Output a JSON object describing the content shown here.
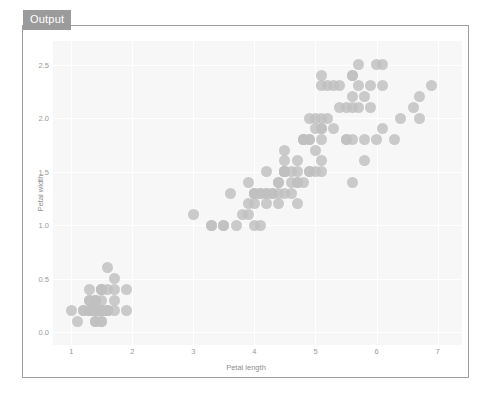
{
  "panel": {
    "tab_label": "Output"
  },
  "chart_data": {
    "type": "scatter",
    "title": "",
    "xlabel": "Petal length",
    "ylabel": "Petal width",
    "xlim": [
      0.7,
      7.4
    ],
    "ylim": [
      -0.12,
      2.72
    ],
    "xticks": [
      "1",
      "2",
      "3",
      "4",
      "5",
      "6",
      "7"
    ],
    "xtick_values": [
      1,
      2,
      3,
      4,
      5,
      6,
      7
    ],
    "yticks": [
      "0.0",
      "0.5",
      "1.0",
      "1.5",
      "2.0",
      "2.5"
    ],
    "ytick_values": [
      0.0,
      0.5,
      1.0,
      1.5,
      2.0,
      2.5
    ],
    "grid": true,
    "legend": "none",
    "marker_color": "#c0c0c0",
    "plot_background": "#f7f7f7",
    "points": [
      [
        1.4,
        0.2
      ],
      [
        1.4,
        0.2
      ],
      [
        1.3,
        0.2
      ],
      [
        1.5,
        0.2
      ],
      [
        1.4,
        0.2
      ],
      [
        1.7,
        0.4
      ],
      [
        1.4,
        0.3
      ],
      [
        1.5,
        0.2
      ],
      [
        1.4,
        0.2
      ],
      [
        1.5,
        0.1
      ],
      [
        1.5,
        0.2
      ],
      [
        1.6,
        0.2
      ],
      [
        1.4,
        0.1
      ],
      [
        1.1,
        0.1
      ],
      [
        1.2,
        0.2
      ],
      [
        1.5,
        0.4
      ],
      [
        1.3,
        0.4
      ],
      [
        1.4,
        0.3
      ],
      [
        1.7,
        0.3
      ],
      [
        1.5,
        0.3
      ],
      [
        1.7,
        0.2
      ],
      [
        1.5,
        0.4
      ],
      [
        1.0,
        0.2
      ],
      [
        1.7,
        0.5
      ],
      [
        1.9,
        0.2
      ],
      [
        1.6,
        0.2
      ],
      [
        1.6,
        0.4
      ],
      [
        1.5,
        0.2
      ],
      [
        1.4,
        0.2
      ],
      [
        1.6,
        0.2
      ],
      [
        1.6,
        0.2
      ],
      [
        1.5,
        0.4
      ],
      [
        1.5,
        0.1
      ],
      [
        1.4,
        0.2
      ],
      [
        1.5,
        0.2
      ],
      [
        1.2,
        0.2
      ],
      [
        1.3,
        0.2
      ],
      [
        1.4,
        0.1
      ],
      [
        1.3,
        0.2
      ],
      [
        1.5,
        0.2
      ],
      [
        1.3,
        0.3
      ],
      [
        1.3,
        0.3
      ],
      [
        1.3,
        0.2
      ],
      [
        1.6,
        0.6
      ],
      [
        1.9,
        0.4
      ],
      [
        1.4,
        0.3
      ],
      [
        1.6,
        0.2
      ],
      [
        1.4,
        0.2
      ],
      [
        1.5,
        0.2
      ],
      [
        1.4,
        0.2
      ],
      [
        4.7,
        1.4
      ],
      [
        4.5,
        1.5
      ],
      [
        4.9,
        1.5
      ],
      [
        4.0,
        1.3
      ],
      [
        4.6,
        1.5
      ],
      [
        4.5,
        1.3
      ],
      [
        4.7,
        1.6
      ],
      [
        3.3,
        1.0
      ],
      [
        4.6,
        1.3
      ],
      [
        3.9,
        1.4
      ],
      [
        3.5,
        1.0
      ],
      [
        4.2,
        1.5
      ],
      [
        4.0,
        1.0
      ],
      [
        4.7,
        1.4
      ],
      [
        3.6,
        1.3
      ],
      [
        4.4,
        1.4
      ],
      [
        4.5,
        1.5
      ],
      [
        4.1,
        1.0
      ],
      [
        4.5,
        1.5
      ],
      [
        3.9,
        1.1
      ],
      [
        4.8,
        1.8
      ],
      [
        4.0,
        1.3
      ],
      [
        4.9,
        1.5
      ],
      [
        4.7,
        1.2
      ],
      [
        4.3,
        1.3
      ],
      [
        4.4,
        1.4
      ],
      [
        4.8,
        1.4
      ],
      [
        5.0,
        1.7
      ],
      [
        4.5,
        1.5
      ],
      [
        3.5,
        1.0
      ],
      [
        3.8,
        1.1
      ],
      [
        3.7,
        1.0
      ],
      [
        3.9,
        1.2
      ],
      [
        5.1,
        1.6
      ],
      [
        4.5,
        1.5
      ],
      [
        4.5,
        1.6
      ],
      [
        4.7,
        1.5
      ],
      [
        4.4,
        1.3
      ],
      [
        4.1,
        1.3
      ],
      [
        4.0,
        1.3
      ],
      [
        4.4,
        1.2
      ],
      [
        4.6,
        1.4
      ],
      [
        4.0,
        1.2
      ],
      [
        3.3,
        1.0
      ],
      [
        4.2,
        1.3
      ],
      [
        4.2,
        1.2
      ],
      [
        4.2,
        1.3
      ],
      [
        4.3,
        1.3
      ],
      [
        3.0,
        1.1
      ],
      [
        4.1,
        1.3
      ],
      [
        6.0,
        2.5
      ],
      [
        5.1,
        1.9
      ],
      [
        5.9,
        2.1
      ],
      [
        5.6,
        1.8
      ],
      [
        5.8,
        2.2
      ],
      [
        6.6,
        2.1
      ],
      [
        4.5,
        1.7
      ],
      [
        6.3,
        1.8
      ],
      [
        5.8,
        1.8
      ],
      [
        6.1,
        2.5
      ],
      [
        5.1,
        2.0
      ],
      [
        5.3,
        1.9
      ],
      [
        5.5,
        2.1
      ],
      [
        5.0,
        2.0
      ],
      [
        5.1,
        2.4
      ],
      [
        5.3,
        2.3
      ],
      [
        5.5,
        1.8
      ],
      [
        6.7,
        2.2
      ],
      [
        6.9,
        2.3
      ],
      [
        5.0,
        1.5
      ],
      [
        5.7,
        2.3
      ],
      [
        4.9,
        2.0
      ],
      [
        6.7,
        2.0
      ],
      [
        4.9,
        1.8
      ],
      [
        5.7,
        2.1
      ],
      [
        6.0,
        1.8
      ],
      [
        4.8,
        1.8
      ],
      [
        4.9,
        1.8
      ],
      [
        5.6,
        2.1
      ],
      [
        5.8,
        1.6
      ],
      [
        6.1,
        1.9
      ],
      [
        6.4,
        2.0
      ],
      [
        5.6,
        2.2
      ],
      [
        5.1,
        1.5
      ],
      [
        5.6,
        1.4
      ],
      [
        6.1,
        2.3
      ],
      [
        5.6,
        2.4
      ],
      [
        5.5,
        1.8
      ],
      [
        4.8,
        1.8
      ],
      [
        5.4,
        2.1
      ],
      [
        5.6,
        2.4
      ],
      [
        5.1,
        2.3
      ],
      [
        5.1,
        1.9
      ],
      [
        5.9,
        2.3
      ],
      [
        5.7,
        2.5
      ],
      [
        5.2,
        2.3
      ],
      [
        5.0,
        1.9
      ],
      [
        5.2,
        2.0
      ],
      [
        5.4,
        2.3
      ],
      [
        5.1,
        1.8
      ]
    ]
  }
}
